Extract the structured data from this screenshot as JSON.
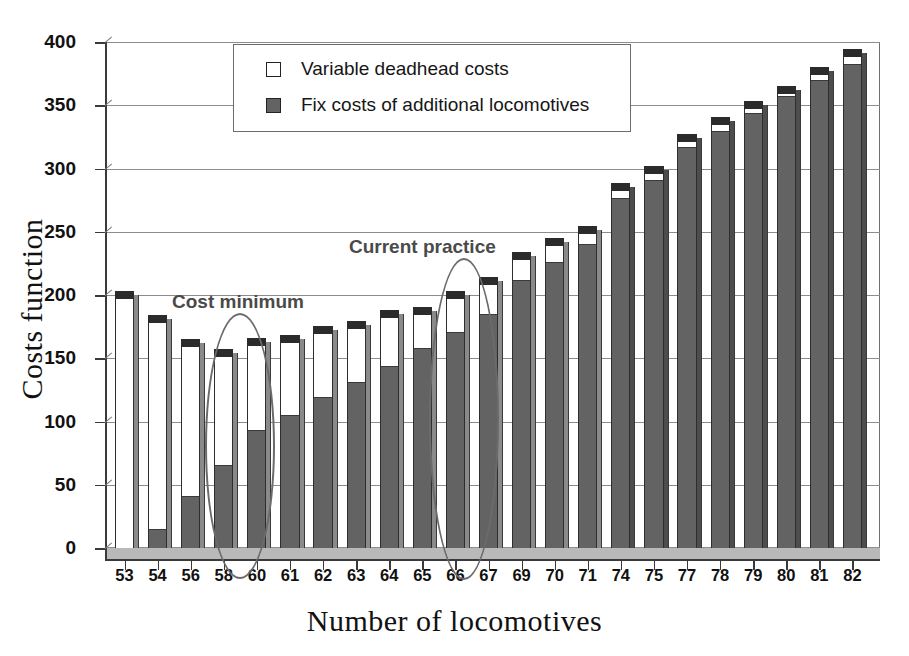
{
  "chart_data": {
    "type": "bar",
    "stacked": true,
    "title": "",
    "xlabel": "Number of locomotives",
    "ylabel": "Costs function",
    "ylim": [
      0,
      400
    ],
    "ytick_values": [
      0,
      50,
      100,
      150,
      200,
      250,
      300,
      350,
      400
    ],
    "grid": true,
    "legend_position": "top-center",
    "categories": [
      "53",
      "54",
      "56",
      "58",
      "60",
      "61",
      "62",
      "63",
      "64",
      "65",
      "66",
      "67",
      "69",
      "70",
      "71",
      "74",
      "75",
      "77",
      "78",
      "79",
      "80",
      "81",
      "82"
    ],
    "series": [
      {
        "name": "Fix costs of additional locomotives",
        "color": "#636363",
        "values": [
          0,
          15,
          41,
          66,
          93,
          105,
          119,
          131,
          144,
          158,
          171,
          185,
          212,
          226,
          240,
          277,
          291,
          317,
          330,
          344,
          357,
          370,
          383
        ]
      },
      {
        "name": "Variable deadhead costs",
        "color": "#ffffff",
        "values": [
          197,
          163,
          118,
          85,
          67,
          57,
          50,
          42,
          38,
          26,
          26,
          23,
          16,
          13,
          8,
          5,
          5,
          4,
          4,
          3,
          2,
          4,
          5
        ]
      }
    ],
    "totals": [
      197,
      178,
      159,
      151,
      160,
      162,
      169,
      173,
      182,
      184,
      197,
      208,
      228,
      239,
      248,
      282,
      296,
      321,
      334,
      347,
      359,
      374,
      388
    ],
    "annotations": [
      {
        "label": "Cost minimum",
        "target_category": "58"
      },
      {
        "label": "Current practice",
        "target_category": "66"
      }
    ]
  },
  "axes": {
    "y_title": "Costs function",
    "x_title": "Number of locomotives",
    "y_ticks": [
      "0",
      "50",
      "100",
      "150",
      "200",
      "250",
      "300",
      "350",
      "400"
    ],
    "x_ticks": [
      "53",
      "54",
      "56",
      "58",
      "60",
      "61",
      "62",
      "63",
      "64",
      "65",
      "66",
      "67",
      "69",
      "70",
      "71",
      "74",
      "75",
      "77",
      "78",
      "79",
      "80",
      "81",
      "82"
    ]
  },
  "legend": {
    "entries": [
      {
        "label": "Variable deadhead costs",
        "swatch": "white-square-icon"
      },
      {
        "label": "Fix costs of additional locomotives",
        "swatch": "gray-square-icon"
      }
    ]
  },
  "annotations": {
    "cost_minimum": "Cost minimum",
    "current_practice": "Current practice"
  },
  "colors": {
    "fix_costs": "#636363",
    "variable_costs": "#ffffff",
    "bar_outline": "#2e2e2e",
    "bar_top_cap": "#2b2b2b",
    "bar_side": "#8a8a8a",
    "gridline": "#8c8c8c",
    "axis": "#3a3a3a",
    "annotation": "#6b6b6b",
    "floor": "#b9b9b9"
  }
}
